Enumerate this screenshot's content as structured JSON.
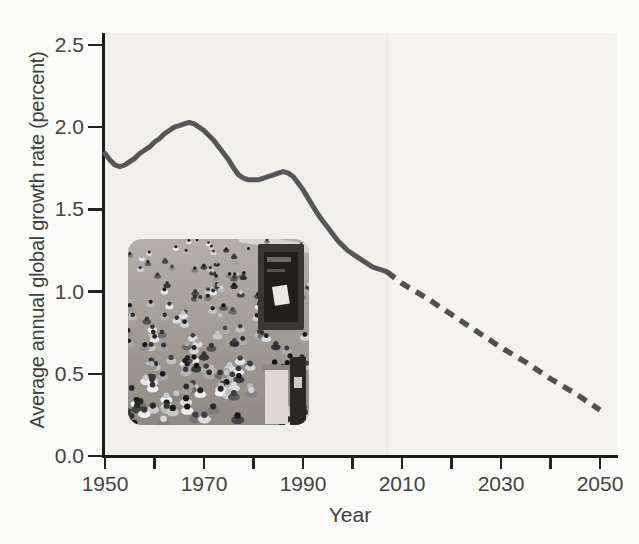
{
  "figure": {
    "xlabel": "Year",
    "ylabel": "Average annual global growth rate (percent)"
  },
  "inset_photo": {
    "name": "crowd-photo",
    "alt": "black-and-white photograph of a dense street crowd"
  },
  "chart_data": {
    "type": "line",
    "title": "",
    "xlabel": "Year",
    "ylabel": "Average annual global growth rate (percent)",
    "xlim": [
      1950,
      2050
    ],
    "ylim": [
      0.0,
      2.5
    ],
    "grid": false,
    "legend": "none",
    "x_ticks": [
      1950,
      1960,
      1970,
      1980,
      1990,
      2000,
      2010,
      2020,
      2030,
      2040,
      2050
    ],
    "x_tick_labels": [
      "1950",
      "",
      "1970",
      "",
      "1990",
      "",
      "2010",
      "",
      "2030",
      "",
      "2050"
    ],
    "y_ticks": [
      0.0,
      0.5,
      1.0,
      1.5,
      2.0,
      2.5
    ],
    "y_tick_labels": [
      "0.0",
      "0.5",
      "1.0",
      "1.5",
      "2.0",
      "2.5"
    ],
    "projection_start_year": 2007,
    "series": [
      {
        "name": "Observed growth rate (solid line)",
        "style": "solid",
        "color": "#565658",
        "points": [
          [
            1950,
            1.84
          ],
          [
            1951,
            1.8
          ],
          [
            1952,
            1.77
          ],
          [
            1953,
            1.76
          ],
          [
            1954,
            1.77
          ],
          [
            1955,
            1.79
          ],
          [
            1956,
            1.81
          ],
          [
            1957,
            1.84
          ],
          [
            1958,
            1.86
          ],
          [
            1959,
            1.88
          ],
          [
            1960,
            1.91
          ],
          [
            1961,
            1.93
          ],
          [
            1962,
            1.96
          ],
          [
            1963,
            1.98
          ],
          [
            1964,
            2.0
          ],
          [
            1965,
            2.01
          ],
          [
            1966,
            2.02
          ],
          [
            1967,
            2.03
          ],
          [
            1968,
            2.02
          ],
          [
            1969,
            2.0
          ],
          [
            1970,
            1.98
          ],
          [
            1971,
            1.95
          ],
          [
            1972,
            1.92
          ],
          [
            1973,
            1.88
          ],
          [
            1974,
            1.84
          ],
          [
            1975,
            1.8
          ],
          [
            1976,
            1.75
          ],
          [
            1977,
            1.71
          ],
          [
            1978,
            1.69
          ],
          [
            1979,
            1.68
          ],
          [
            1980,
            1.68
          ],
          [
            1981,
            1.68
          ],
          [
            1982,
            1.69
          ],
          [
            1983,
            1.7
          ],
          [
            1984,
            1.71
          ],
          [
            1985,
            1.72
          ],
          [
            1986,
            1.73
          ],
          [
            1987,
            1.72
          ],
          [
            1988,
            1.7
          ],
          [
            1989,
            1.66
          ],
          [
            1990,
            1.62
          ],
          [
            1991,
            1.57
          ],
          [
            1992,
            1.52
          ],
          [
            1993,
            1.47
          ],
          [
            1994,
            1.43
          ],
          [
            1995,
            1.39
          ],
          [
            1996,
            1.35
          ],
          [
            1997,
            1.31
          ],
          [
            1998,
            1.28
          ],
          [
            1999,
            1.25
          ],
          [
            2000,
            1.23
          ],
          [
            2001,
            1.21
          ],
          [
            2002,
            1.19
          ],
          [
            2003,
            1.17
          ],
          [
            2004,
            1.15
          ],
          [
            2005,
            1.14
          ],
          [
            2006,
            1.13
          ],
          [
            2007,
            1.12
          ]
        ]
      },
      {
        "name": "Projected growth rate (dashed line)",
        "style": "dashed",
        "color": "#505052",
        "points": [
          [
            2007,
            1.12
          ],
          [
            2010,
            1.05
          ],
          [
            2015,
            0.96
          ],
          [
            2020,
            0.86
          ],
          [
            2025,
            0.76
          ],
          [
            2030,
            0.66
          ],
          [
            2035,
            0.57
          ],
          [
            2040,
            0.47
          ],
          [
            2045,
            0.38
          ],
          [
            2050,
            0.28
          ]
        ]
      }
    ]
  }
}
